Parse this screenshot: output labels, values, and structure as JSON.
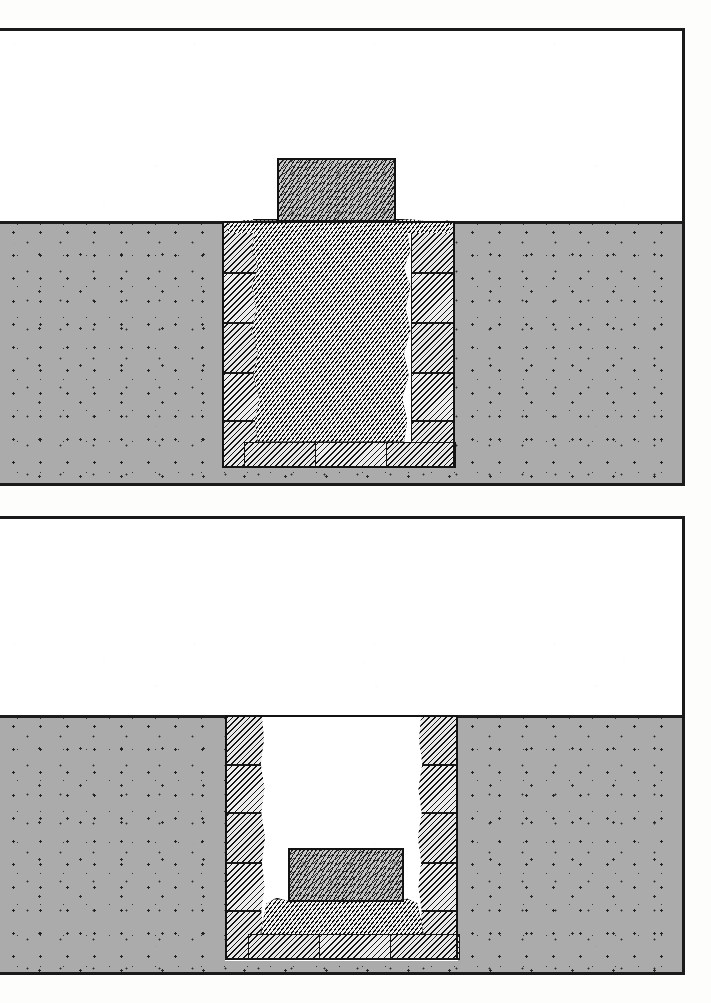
{
  "document": {
    "kind": "hand-drawn archaeological cross-section plate",
    "background_color": "#fdfdfc",
    "ink_color": "#141414",
    "panel_count": 2
  },
  "palette": {
    "soil_fill": "#ababab",
    "soil_stipple_dot": "#161616",
    "masonry_hatch_light": "#e8e8e8",
    "masonry_hatch_dark": "#141414",
    "rubble_fill": "#bdbdbd",
    "capstone_fill": "#c9c9c9",
    "void_white": "#ffffff",
    "border": "#1a1a1a"
  },
  "panels": [
    {
      "id": "panel-upper",
      "label": "upper-section",
      "frame": {
        "x": 0,
        "y": 28,
        "width": 685,
        "height": 458,
        "border_px": 3,
        "open_side": "left"
      },
      "ground": {
        "label": "ground-surface",
        "surface_y": 190,
        "fill": "#ababab",
        "texture": "stipple-dots"
      },
      "shaft": {
        "label": "stone-lined-shaft",
        "x": 222,
        "width": 233,
        "top_y": 190,
        "bottom_y": 437,
        "state": "backfilled"
      },
      "left_wall": {
        "label": "left-revetment-wall",
        "x": 222,
        "width": 42,
        "courses": 5,
        "texture": "diagonal-hatch"
      },
      "right_wall": {
        "label": "right-revetment-wall",
        "x": 413,
        "width": 42,
        "courses": 5,
        "texture": "diagonal-hatch"
      },
      "fill": {
        "label": "rubble-backfill",
        "texture": "woven-crosshatch",
        "top_y": 190,
        "bottom_y": 412
      },
      "floor": {
        "label": "floor-slabs",
        "slab_count": 3,
        "top_y": 412,
        "bottom_y": 437,
        "texture": "diagonal-hatch"
      },
      "marker": {
        "label": "capstone-marker",
        "x": 277,
        "y": 127,
        "width": 119,
        "height": 63,
        "texture": "mottled-stone",
        "position": "above-ground"
      }
    },
    {
      "id": "panel-lower",
      "label": "lower-section",
      "frame": {
        "x": 0,
        "y": 516,
        "width": 685,
        "height": 459,
        "border_px": 3,
        "open_side": "left"
      },
      "ground": {
        "label": "ground-surface",
        "surface_y": 196,
        "fill": "#ababab",
        "texture": "stipple-dots"
      },
      "shaft": {
        "label": "stone-lined-shaft",
        "x": 225,
        "width": 233,
        "top_y": 196,
        "bottom_y": 441,
        "state": "excavated-open"
      },
      "left_wall": {
        "label": "left-revetment-wall",
        "x": 225,
        "width": 40,
        "courses": 5,
        "texture": "diagonal-hatch"
      },
      "right_wall": {
        "label": "right-revetment-wall",
        "x": 418,
        "width": 40,
        "courses": 5,
        "texture": "diagonal-hatch"
      },
      "void": {
        "label": "open-shaft-void",
        "top_y": 196,
        "bottom_y": 380,
        "fill": "#ffffff"
      },
      "deposit": {
        "label": "rubble-deposit",
        "texture": "woven-crosshatch",
        "top_y": 380,
        "bottom_y": 416
      },
      "floor": {
        "label": "floor-slabs",
        "slab_count": 3,
        "top_y": 416,
        "bottom_y": 441,
        "texture": "diagonal-hatch"
      },
      "marker": {
        "label": "in-situ-stone-block",
        "x": 288,
        "y": 329,
        "width": 116,
        "height": 54,
        "texture": "mottled-stone",
        "position": "on-deposit-surface"
      }
    }
  ]
}
